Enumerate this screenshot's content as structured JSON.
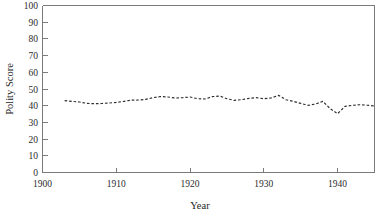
{
  "chart_data": {
    "type": "line",
    "title": "",
    "subtitle": "",
    "xlabel": "Year",
    "ylabel": "Polity Score",
    "xlim": [
      1900,
      1945
    ],
    "ylim": [
      0,
      100
    ],
    "grid": false,
    "legend": null,
    "legend_position": "none",
    "xticks": [
      1900,
      1910,
      1920,
      1930,
      1940
    ],
    "xtick_labels": [
      "1900",
      "1910",
      "1920",
      "1930",
      "1940"
    ],
    "yticks": [
      0,
      10,
      20,
      30,
      40,
      50,
      60,
      70,
      80,
      90,
      100
    ],
    "ytick_labels": [
      "0",
      "10",
      "20",
      "30",
      "40",
      "50",
      "60",
      "70",
      "80",
      "90",
      "100"
    ],
    "line_style": "dashed",
    "line_color": "#2f2f2f",
    "marker": "none",
    "series": [
      {
        "name": "Polity Score",
        "x": [
          1903,
          1904,
          1905,
          1906,
          1907,
          1908,
          1909,
          1910,
          1911,
          1912,
          1913,
          1914,
          1915,
          1916,
          1917,
          1918,
          1919,
          1920,
          1921,
          1922,
          1923,
          1924,
          1925,
          1926,
          1927,
          1928,
          1929,
          1930,
          1931,
          1932,
          1933,
          1934,
          1935,
          1936,
          1937,
          1938,
          1939,
          1940,
          1941,
          1942,
          1943,
          1944,
          1945
        ],
        "values": [
          43.0,
          42.6,
          42.2,
          41.4,
          41.2,
          41.3,
          41.6,
          42.0,
          42.6,
          43.3,
          43.4,
          43.8,
          44.8,
          45.5,
          45.2,
          44.6,
          44.8,
          45.2,
          44.2,
          44.0,
          45.4,
          45.8,
          44.2,
          43.2,
          43.6,
          44.4,
          44.8,
          44.2,
          44.6,
          46.2,
          43.6,
          42.6,
          41.4,
          40.2,
          41.0,
          42.6,
          38.2,
          35.2,
          39.6,
          40.2,
          40.6,
          40.3,
          39.8
        ]
      }
    ]
  },
  "axes": {
    "y_axis_title": "Polity Score",
    "x_axis_title": "Year"
  }
}
